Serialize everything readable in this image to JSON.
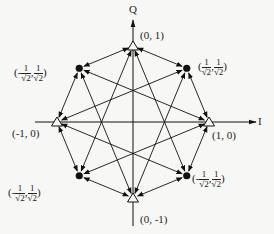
{
  "axes": {
    "x_label": "I",
    "y_label": "Q"
  },
  "points": [
    {
      "id": "p0",
      "kind": "triangle",
      "i": 0,
      "q": 1,
      "label_text": "(0, 1)"
    },
    {
      "id": "p1",
      "kind": "dot",
      "i": 0.7071,
      "q": 0.7071,
      "label_sign": "",
      "label_parts": [
        "1",
        "√2",
        "1",
        "√2"
      ]
    },
    {
      "id": "p2",
      "kind": "triangle",
      "i": 1,
      "q": 0,
      "label_text": "(1, 0)"
    },
    {
      "id": "p3",
      "kind": "dot",
      "i": 0.7071,
      "q": -0.7071,
      "label_sign": "-",
      "label_parts": [
        "1",
        "√2",
        "1",
        "√2"
      ]
    },
    {
      "id": "p4",
      "kind": "triangle",
      "i": 0,
      "q": -1,
      "label_text": "(0, -1)"
    },
    {
      "id": "p5",
      "kind": "dot",
      "i": -0.7071,
      "q": -0.7071,
      "label_sign": "-",
      "label_parts": [
        "1",
        "√2",
        "1",
        "√2"
      ]
    },
    {
      "id": "p6",
      "kind": "triangle",
      "i": -1,
      "q": 0,
      "label_text": "(-1, 0)"
    },
    {
      "id": "p7",
      "kind": "dot",
      "i": -0.7071,
      "q": 0.7071,
      "label_sign": "-",
      "label_parts": [
        "1",
        "√2",
        "1",
        "√2"
      ]
    }
  ],
  "transitions": {
    "octagon_edges": "bidirectional between adjacent points",
    "star_edges": "bidirectional between points 3 apart (octagram)"
  }
}
